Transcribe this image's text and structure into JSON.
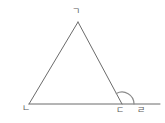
{
  "figure": {
    "background_color": "#ffffff",
    "stroke_color": "#6b6b6b",
    "label_color": "#5a5a5a",
    "stroke_width": 1
  },
  "labels": {
    "apex": "ㄱ",
    "base_left": "ㄴ",
    "base_right": "ㄷ",
    "extension_end": "ㄹ"
  },
  "chart_data": {
    "type": "diagram",
    "points": [
      {
        "name": "ㄱ",
        "x": 78,
        "y": 22,
        "role": "apex"
      },
      {
        "name": "ㄴ",
        "x": 29,
        "y": 104,
        "role": "base-left-vertex"
      },
      {
        "name": "ㄷ",
        "x": 122,
        "y": 104,
        "role": "base-right-vertex"
      },
      {
        "name": "ㄹ",
        "x": 160,
        "y": 104,
        "role": "extension-endpoint"
      }
    ],
    "segments": [
      {
        "from": "ㄴ",
        "to": "ㄱ",
        "kind": "triangle-side"
      },
      {
        "from": "ㄱ",
        "to": "ㄷ",
        "kind": "triangle-side"
      },
      {
        "from": "ㄴ",
        "to": "ㄷ",
        "kind": "triangle-base"
      },
      {
        "from": "ㄷ",
        "to": "ㄹ",
        "kind": "base-extension"
      }
    ],
    "angle_marks": [
      {
        "vertex": "ㄷ",
        "between": [
          "ㄱ",
          "ㄹ"
        ],
        "kind": "exterior-angle-arc",
        "radius": 12
      }
    ]
  }
}
